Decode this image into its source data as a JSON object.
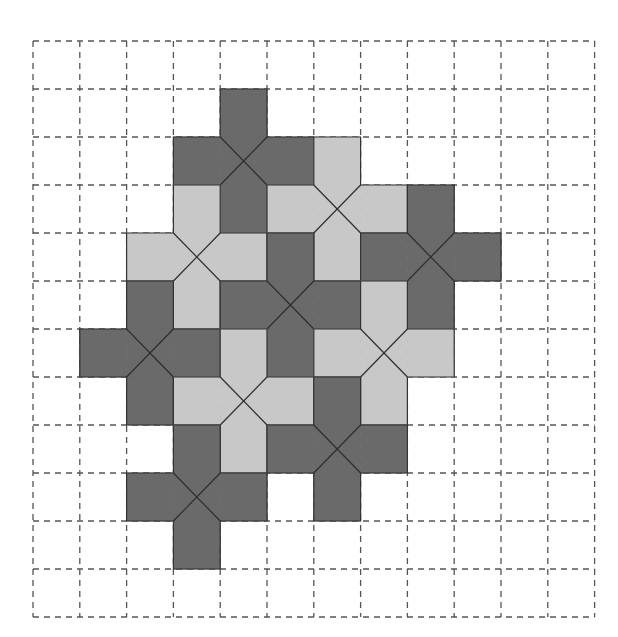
{
  "diagram": {
    "type": "tiling-puzzle",
    "grid": {
      "columns": 12,
      "rows": 12,
      "origin_x": 33,
      "origin_y": 41,
      "cell_width": 46.8,
      "cell_height": 48,
      "line_style": "dashed"
    },
    "colors": {
      "dark": "#6a6a6a",
      "light": "#c8c8c8",
      "background": "#ffffff",
      "grid": "#555555"
    },
    "pieces": [
      {
        "id": 1,
        "shape": "plus-cross",
        "center": {
          "col": 4,
          "row": 2
        },
        "tone": "dark"
      },
      {
        "id": 2,
        "shape": "plus-cross",
        "center": {
          "col": 6,
          "row": 3
        },
        "tone": "light"
      },
      {
        "id": 3,
        "shape": "plus-cross",
        "center": {
          "col": 3,
          "row": 4
        },
        "tone": "light"
      },
      {
        "id": 4,
        "shape": "plus-cross",
        "center": {
          "col": 8,
          "row": 4
        },
        "tone": "dark"
      },
      {
        "id": 5,
        "shape": "plus-cross",
        "center": {
          "col": 5,
          "row": 5
        },
        "tone": "dark"
      },
      {
        "id": 6,
        "shape": "plus-cross",
        "center": {
          "col": 2,
          "row": 6
        },
        "tone": "dark"
      },
      {
        "id": 7,
        "shape": "plus-cross",
        "center": {
          "col": 7,
          "row": 6
        },
        "tone": "light"
      },
      {
        "id": 8,
        "shape": "plus-cross",
        "center": {
          "col": 4,
          "row": 7
        },
        "tone": "light"
      },
      {
        "id": 9,
        "shape": "plus-cross",
        "center": {
          "col": 6,
          "row": 8
        },
        "tone": "dark"
      },
      {
        "id": 10,
        "shape": "plus-cross",
        "center": {
          "col": 3,
          "row": 9
        },
        "tone": "dark"
      }
    ]
  }
}
